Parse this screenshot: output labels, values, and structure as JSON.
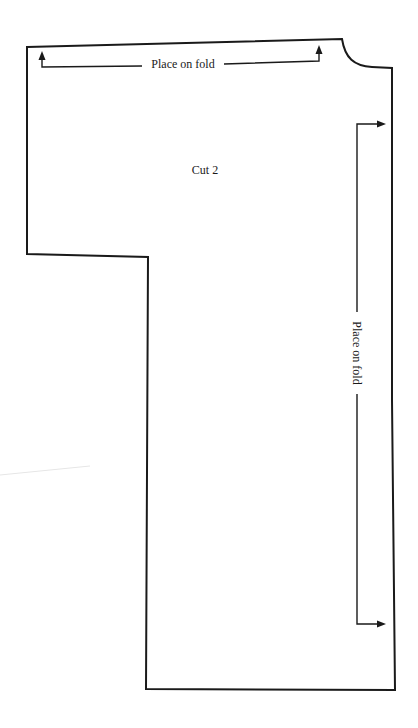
{
  "diagram": {
    "type": "sewing-pattern-piece",
    "instruction": "Cut 2",
    "fold_labels": {
      "top": "Place on fold",
      "right": "Place on fold"
    },
    "colors": {
      "line": "#1a1a1a",
      "background": "#ffffff"
    }
  }
}
